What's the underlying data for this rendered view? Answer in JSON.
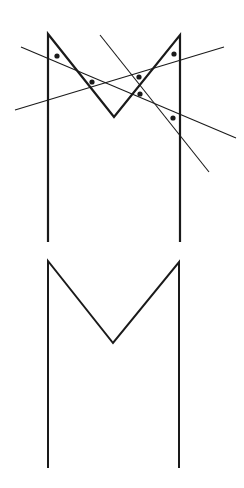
{
  "diagram": {
    "background": "#ffffff",
    "stroke_color": "#1a1a1a",
    "upper_figure": {
      "shape": "M",
      "points": [
        [
          48,
          242
        ],
        [
          48,
          34
        ],
        [
          114,
          117
        ],
        [
          180,
          35
        ],
        [
          180,
          242
        ]
      ],
      "stroke_width": 2.2,
      "lines": [
        {
          "x1": 21,
          "y1": 47,
          "x2": 236,
          "y2": 138
        },
        {
          "x1": 15,
          "y1": 110,
          "x2": 224,
          "y2": 47
        },
        {
          "x1": 100,
          "y1": 35,
          "x2": 209,
          "y2": 172
        }
      ],
      "line_stroke_width": 1.1,
      "dots": [
        {
          "cx": 57,
          "cy": 56
        },
        {
          "cx": 92,
          "cy": 82
        },
        {
          "cx": 139,
          "cy": 77
        },
        {
          "cx": 140,
          "cy": 94
        },
        {
          "cx": 174,
          "cy": 54
        },
        {
          "cx": 173,
          "cy": 118
        }
      ],
      "dot_radius": 2.6
    },
    "lower_figure": {
      "shape": "M",
      "points": [
        [
          48,
          468
        ],
        [
          48,
          261
        ],
        [
          113,
          343
        ],
        [
          179,
          262
        ],
        [
          179,
          468
        ]
      ],
      "stroke_width": 2.0
    }
  }
}
